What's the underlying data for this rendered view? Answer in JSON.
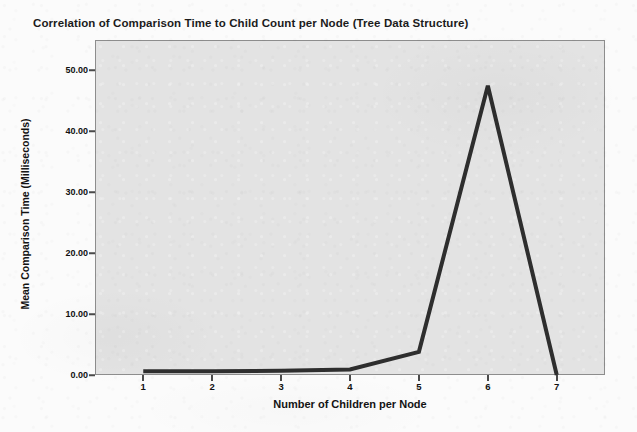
{
  "chart_data": {
    "type": "line",
    "title": "Correlation of Comparison Time to Child Count per Node (Tree Data Structure)",
    "xlabel": "Number of Children per Node",
    "ylabel": "Mean Comparison Time (Milliseconds)",
    "x": [
      1,
      2,
      3,
      4,
      5,
      6,
      7
    ],
    "values": [
      0.6,
      0.6,
      0.7,
      0.9,
      3.8,
      47.5,
      0.0
    ],
    "series": [
      {
        "name": "Mean Comparison Time",
        "values": [
          0.6,
          0.6,
          0.7,
          0.9,
          3.8,
          47.5,
          0.0
        ]
      }
    ],
    "x_tick_labels": [
      "1",
      "2",
      "3",
      "4",
      "5",
      "6",
      "7"
    ],
    "y_tick_labels": [
      "0.00",
      "10.00",
      "20.00",
      "30.00",
      "40.00",
      "50.00"
    ],
    "y_tick_values": [
      0,
      10,
      20,
      30,
      40,
      50
    ],
    "xlim": [
      0.3,
      7.7
    ],
    "ylim": [
      0,
      55
    ],
    "grid": false,
    "legend": false,
    "line_color": "#2e2e2e",
    "line_width": 4,
    "plot_background": "#e3e3e3",
    "page_background": "#fbfbfb",
    "plot_border_color": "#8d8d8d"
  }
}
